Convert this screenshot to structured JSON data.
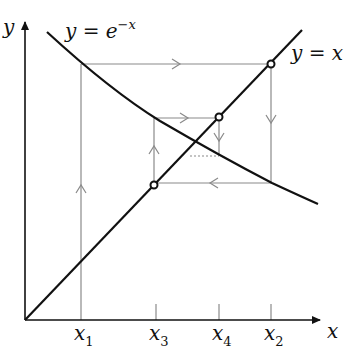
{
  "diagram": {
    "type": "cobweb",
    "axes": {
      "x_label": "x",
      "y_label": "y"
    },
    "curves": [
      {
        "name": "exp-decay",
        "label_main": "y = e",
        "label_sup": "−x"
      },
      {
        "name": "identity",
        "label": "y = x"
      }
    ],
    "ticks": [
      {
        "name": "x1",
        "base": "x",
        "sub": "1"
      },
      {
        "name": "x3",
        "base": "x",
        "sub": "3"
      },
      {
        "name": "x4",
        "base": "x",
        "sub": "4"
      },
      {
        "name": "x2",
        "base": "x",
        "sub": "2"
      }
    ],
    "colors": {
      "curve": "#111111",
      "cobweb": "#8a8a8a",
      "axis": "#111111"
    }
  }
}
